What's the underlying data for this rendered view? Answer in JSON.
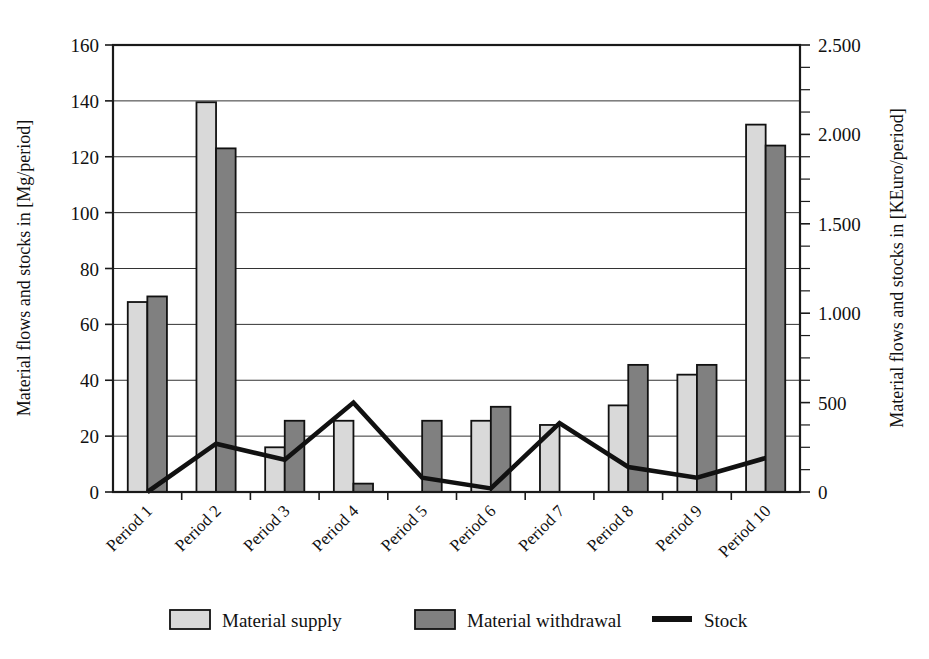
{
  "chart_data": {
    "type": "bar",
    "title": "",
    "subtitle": "",
    "xlabel": "",
    "ylabel": "Material flows and stocks in [Mg/period]",
    "y2label": "Material flows and stocks in [KEuro/period]",
    "categories": [
      "Period 1",
      "Period 2",
      "Period 3",
      "Period 4",
      "Period 5",
      "Period 6",
      "Period 7",
      "Period 8",
      "Period 9",
      "Period 10"
    ],
    "series": [
      {
        "name": "Material supply",
        "axis": "left",
        "type": "bar",
        "color": "#d9d9d9",
        "values": [
          68,
          139.5,
          16,
          25.5,
          0,
          25.5,
          24,
          31,
          42,
          131.5
        ]
      },
      {
        "name": "Material withdrawal",
        "axis": "left",
        "type": "bar",
        "color": "#808080",
        "values": [
          70,
          123,
          25.5,
          3,
          25.5,
          30.5,
          0,
          45.5,
          45.5,
          124
        ]
      },
      {
        "name": "Stock",
        "axis": "right",
        "type": "line",
        "color": "#111111",
        "values": [
          0,
          270,
          180,
          500,
          80,
          20,
          385,
          140,
          80,
          190
        ]
      }
    ],
    "ylim": [
      0,
      160
    ],
    "yticks": [
      0,
      20,
      40,
      60,
      80,
      100,
      120,
      140,
      160
    ],
    "yticklabels": [
      "0",
      "20",
      "40",
      "60",
      "80",
      "100",
      "120",
      "140",
      "160"
    ],
    "y2lim": [
      0,
      2500
    ],
    "y2ticks": [
      0,
      500,
      1000,
      1500,
      2000,
      2500
    ],
    "y2ticklabels": [
      "0",
      "500",
      "1.000",
      "1.500",
      "2.000",
      "2.500"
    ],
    "y2minorticks": [
      125,
      250,
      375,
      625,
      750,
      875,
      1125,
      1250,
      1375,
      1625,
      1750,
      1875,
      2125,
      2250,
      2375
    ],
    "grid": true,
    "grid_axis": "y",
    "legend_position": "bottom",
    "legend": [
      {
        "label": "Material supply",
        "marker": "square",
        "color": "#d9d9d9"
      },
      {
        "label": "Material withdrawal",
        "marker": "square",
        "color": "#808080"
      },
      {
        "label": "Stock",
        "marker": "line",
        "color": "#111111"
      }
    ]
  },
  "colors": {
    "supply_fill": "#d9d9d9",
    "withdrawal_fill": "#808080",
    "stock_stroke": "#111111",
    "frame_stroke": "#1a1a1a",
    "grid_stroke": "#333333",
    "background": "#ffffff"
  }
}
